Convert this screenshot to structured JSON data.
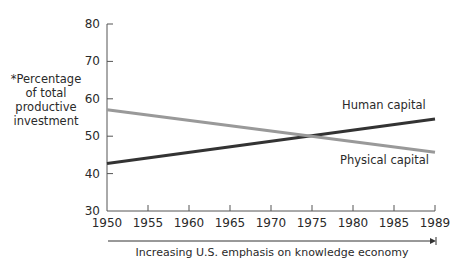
{
  "chart_data": {
    "type": "line",
    "title": "",
    "xlabel": "Increasing U.S. emphasis on knowledge economy",
    "ylabel": "*Percentage of total productive investment",
    "ylabel_lines": [
      "*Percentage",
      "of total",
      "productive",
      "investment"
    ],
    "x_ticks": [
      "1950",
      "1955",
      "1960",
      "1965",
      "1970",
      "1975",
      "1980",
      "1985",
      "1989"
    ],
    "y_ticks": [
      30,
      40,
      50,
      60,
      70,
      80
    ],
    "ylim": [
      30,
      80
    ],
    "xlim": [
      1950,
      1989
    ],
    "grid": false,
    "legend": "inline labels",
    "series": [
      {
        "name": "Human capital",
        "color": "#333333",
        "x": [
          1950,
          1989
        ],
        "values": [
          42.7,
          54.6
        ]
      },
      {
        "name": "Physical capital",
        "color": "#999999",
        "x": [
          1950,
          1989
        ],
        "values": [
          57.1,
          45.7
        ]
      }
    ],
    "annotations": [
      {
        "text": "Human capital",
        "near": "end of Human capital line, above"
      },
      {
        "text": "Physical capital",
        "near": "end of Physical capital line, below"
      },
      {
        "text": "Increasing U.S. emphasis on knowledge economy",
        "type": "arrow label under x-axis"
      }
    ]
  }
}
